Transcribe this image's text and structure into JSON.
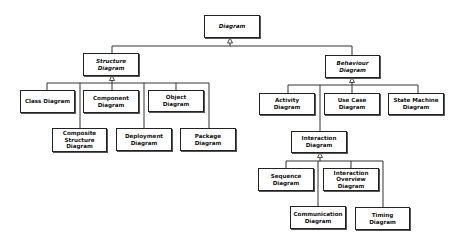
{
  "diagram": {
    "root": "Diagram",
    "structure": {
      "title": "Structure Diagram",
      "label_1": "Structure",
      "label_2": "Diagram",
      "children": {
        "class": "Class Diagram",
        "component_1": "Component",
        "component_2": "Diagram",
        "object_1": "Object",
        "object_2": "Diagram",
        "composite_1": "Composite",
        "composite_2": "Structure",
        "composite_3": "Diagram",
        "deployment_1": "Deployment",
        "deployment_2": "Diagram",
        "package_1": "Package",
        "package_2": "Diagram"
      }
    },
    "behaviour": {
      "label_1": "Behaviour",
      "label_2": "Diagram",
      "children": {
        "activity_1": "Activity",
        "activity_2": "Diagram",
        "usecase_1": "Use Case",
        "usecase_2": "Diagram",
        "state_1": "State Machine",
        "state_2": "Diagram",
        "interaction_1": "Interaction",
        "interaction_2": "Diagram"
      }
    },
    "interaction": {
      "sequence_1": "Sequence",
      "sequence_2": "Diagram",
      "overview_1": "Interaction",
      "overview_2": "Overview",
      "overview_3": "Diagram",
      "communication_1": "Communication",
      "communication_2": "Diagram",
      "timing_1": "Timing",
      "timing_2": "Diagram"
    },
    "relationship": "generalization (hollow triangle)"
  }
}
